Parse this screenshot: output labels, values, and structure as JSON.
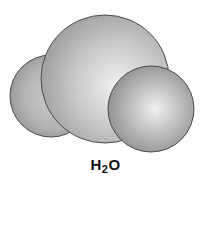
{
  "diagram": {
    "type": "space-filling molecular model",
    "molecule": {
      "formula_main": "H",
      "formula_sub": "2",
      "formula_tail": "O",
      "label": "H2O"
    },
    "atoms": [
      {
        "name": "hydrogen-left",
        "cx": 51,
        "cy": 96,
        "r": 41
      },
      {
        "name": "oxygen",
        "cx": 105,
        "cy": 79,
        "r": 64
      },
      {
        "name": "hydrogen-right",
        "cx": 151,
        "cy": 109,
        "r": 43
      }
    ],
    "colors": {
      "sphere_highlight": "#f2f2f2",
      "sphere_mid": "#c4c4c4",
      "sphere_edge": "#8c8c8c",
      "outline": "#4a4a4a",
      "label": "#111111"
    }
  }
}
